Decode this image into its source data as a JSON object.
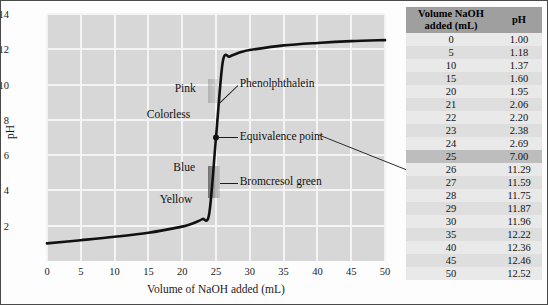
{
  "chart_data": {
    "type": "line",
    "title": "",
    "xlabel": "Volume of NaOH added (mL)",
    "ylabel": "pH",
    "xlim": [
      0,
      50
    ],
    "ylim": [
      0,
      14
    ],
    "xticks": [
      0,
      5,
      10,
      15,
      20,
      25,
      30,
      35,
      40,
      45,
      50
    ],
    "yticks": [
      2,
      4,
      6,
      8,
      10,
      12,
      14
    ],
    "grid": true,
    "legend_position": "none",
    "series": [
      {
        "name": "Titration curve (strong acid with NaOH)",
        "x": [
          0,
          5,
          10,
          15,
          20,
          21,
          22,
          23,
          24,
          25,
          26,
          27,
          28,
          29,
          30,
          35,
          40,
          45,
          50
        ],
        "values": [
          1.0,
          1.18,
          1.37,
          1.6,
          1.95,
          2.06,
          2.2,
          2.38,
          2.69,
          7.0,
          11.29,
          11.59,
          11.75,
          11.87,
          11.96,
          12.22,
          12.36,
          12.46,
          12.52
        ]
      }
    ],
    "annotations": [
      {
        "name": "pink",
        "label": "Pink",
        "x": 22.0,
        "y": 9.7
      },
      {
        "name": "colorless",
        "label": "Colorless",
        "x": 21.2,
        "y": 8.2
      },
      {
        "name": "blue",
        "label": "Blue",
        "x": 21.9,
        "y": 5.2
      },
      {
        "name": "yellow",
        "label": "Yellow",
        "x": 21.5,
        "y": 3.4
      },
      {
        "name": "phenolphthalein",
        "label": "Phenolphthalein",
        "x": 28.5,
        "y": 10.0
      },
      {
        "name": "equivalence-point",
        "label": "Equivalence point",
        "x": 28.5,
        "y": 7.0
      },
      {
        "name": "bromcresol-green",
        "label": "Bromcresol green",
        "x": 28.5,
        "y": 4.4
      }
    ],
    "markers": [
      {
        "name": "equivalence-point-marker",
        "x": 25,
        "y": 7.0
      }
    ],
    "indicator_bands": [
      {
        "name": "phenolphthalein-band",
        "ph_range": [
          8.3,
          10.0
        ]
      },
      {
        "name": "bromcresol-green-band",
        "ph_range": [
          3.8,
          5.4
        ]
      }
    ]
  },
  "table": {
    "headers": [
      "Volume NaOH added (mL)",
      "pH"
    ],
    "header_line1": "Volume NaOH",
    "header_line2": "added (mL)",
    "header_ph": "pH",
    "highlight_row_index": 9,
    "rows": [
      {
        "volume": "0",
        "ph": "1.00"
      },
      {
        "volume": "5",
        "ph": "1.18"
      },
      {
        "volume": "10",
        "ph": "1.37"
      },
      {
        "volume": "15",
        "ph": "1.60"
      },
      {
        "volume": "20",
        "ph": "1.95"
      },
      {
        "volume": "21",
        "ph": "2.06"
      },
      {
        "volume": "22",
        "ph": "2.20"
      },
      {
        "volume": "23",
        "ph": "2.38"
      },
      {
        "volume": "24",
        "ph": "2.69"
      },
      {
        "volume": "25",
        "ph": "7.00"
      },
      {
        "volume": "26",
        "ph": "11.29"
      },
      {
        "volume": "27",
        "ph": "11.59"
      },
      {
        "volume": "28",
        "ph": "11.75"
      },
      {
        "volume": "29",
        "ph": "11.87"
      },
      {
        "volume": "30",
        "ph": "11.96"
      },
      {
        "volume": "35",
        "ph": "12.22"
      },
      {
        "volume": "40",
        "ph": "12.36"
      },
      {
        "volume": "45",
        "ph": "12.46"
      },
      {
        "volume": "50",
        "ph": "12.52"
      }
    ]
  },
  "colors": {
    "plot_background": "#d7d7d7",
    "gridline": "#f4f4f4",
    "curve": "#111111",
    "table_header_background": "#9f9f9f",
    "table_row_background": "#e9e9e9",
    "table_row_alt_background": "#dedede",
    "table_highlight_background": "#bdbdbd",
    "figure_border": "#4a4a4a"
  }
}
